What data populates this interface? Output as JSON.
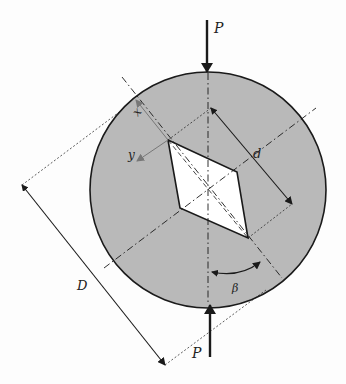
{
  "diagram": {
    "type": "brazilian-disc-specimen-with-rhombic-flaw",
    "labels": {
      "load_top": "P",
      "load_bottom": "P",
      "diameter": "D",
      "flaw_length": "d",
      "angle": "β",
      "axis_x": "x",
      "axis_y": "y"
    },
    "colors": {
      "disc_fill": "#b9b9b9",
      "flaw_fill": "#ffffff",
      "stroke": "#1a1a1a",
      "axis_arrow": "#777777"
    }
  }
}
